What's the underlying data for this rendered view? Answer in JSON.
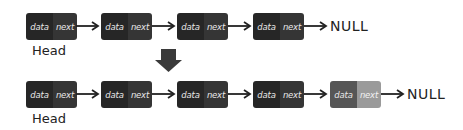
{
  "diagram": {
    "before": {
      "nodes": [
        {
          "data": "data",
          "next": "next"
        },
        {
          "data": "data",
          "next": "next"
        },
        {
          "data": "data",
          "next": "next"
        },
        {
          "data": "data",
          "next": "next"
        }
      ],
      "head_label": "Head",
      "terminal": "NULL"
    },
    "transition_icon": "down-arrow-icon",
    "after": {
      "nodes": [
        {
          "data": "data",
          "next": "next"
        },
        {
          "data": "data",
          "next": "next"
        },
        {
          "data": "data",
          "next": "next"
        },
        {
          "data": "data",
          "next": "next"
        },
        {
          "data": "data",
          "next": "next",
          "new": true
        }
      ],
      "head_label": "Head",
      "terminal": "NULL"
    },
    "colors": {
      "node_data": "#262626",
      "node_next": "#353535",
      "new_node_data": "#565656",
      "new_node_next": "#9a9a9a",
      "arrow": "#222222",
      "background": "#ffffff"
    }
  }
}
